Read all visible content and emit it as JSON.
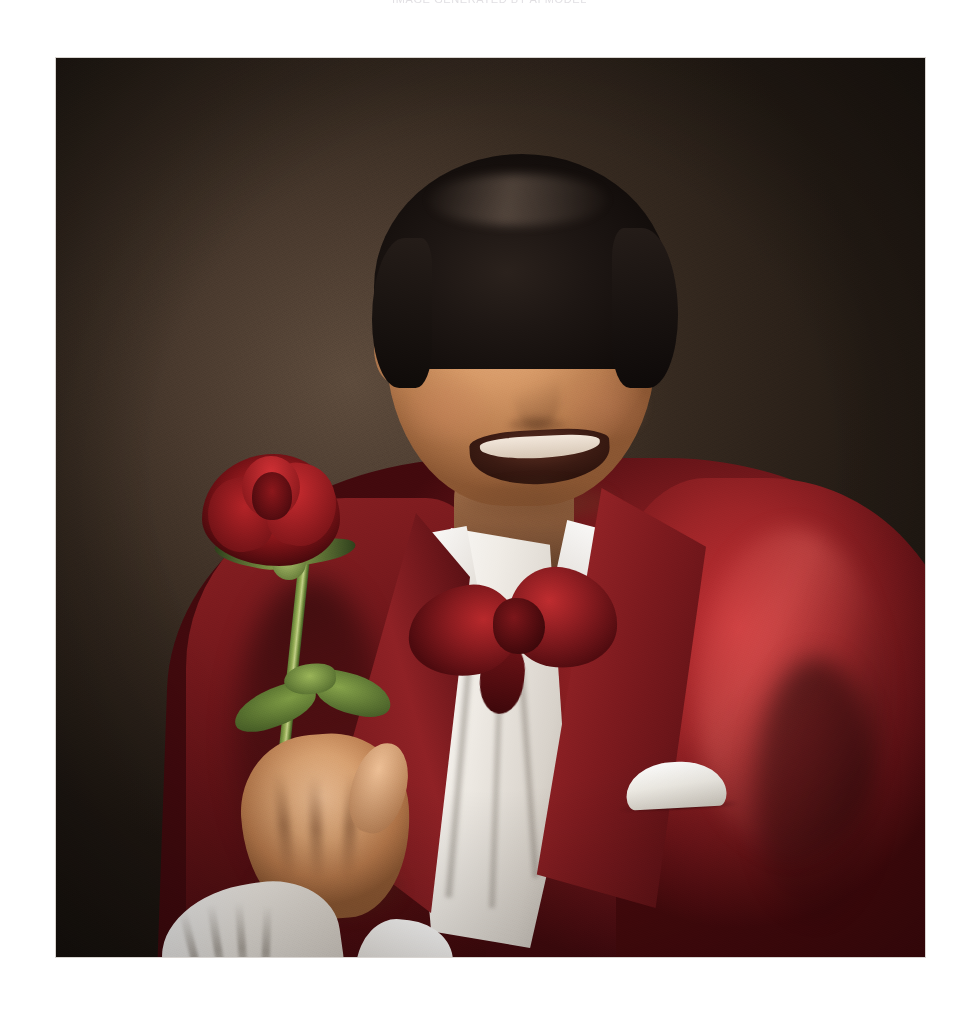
{
  "page": {
    "background_color": "#ffffff",
    "width": 979,
    "height": 1015
  },
  "top_caption": {
    "text": "IMAGE GENERATED BY AI MODEL",
    "note": "clipped at top edge of page, only faint glyph bottoms visible"
  },
  "photo": {
    "alt_description": "Studio portrait photograph of a smiling middle-aged man with dark swept-back hair, wearing a glossy red satin tuxedo jacket over a white ruffled dress shirt with a large crimson bow tie and a white pocket square, holding a single long-stemmed red rose in his right hand.",
    "frame": {
      "left": 56,
      "top": 58,
      "width": 869,
      "height": 899
    },
    "colors": {
      "backdrop_dark": "#2e241c",
      "backdrop_light": "#5d4b3c",
      "jacket_red": "#9c2427",
      "jacket_highlight": "#c23034",
      "jacket_shadow": "#42090d",
      "shirt_white": "#ffffff",
      "shirt_shadow": "#b9b2a9",
      "bowtie_red": "#8e1d21",
      "rose_red": "#9b1a1e",
      "rose_highlight": "#d13135",
      "stem_green": "#93ab53",
      "leaf_green": "#7d9a44",
      "skin_light": "#ecbd93",
      "skin_mid": "#d79a68",
      "skin_shadow": "#8a5632",
      "hair_dark": "#1d1613"
    },
    "elements": {
      "backdrop": "mottled dark brown studio backdrop with soft vignette",
      "head": "smiling face, eyes creased, visible teeth",
      "hair": "dark brown-black hair swept back with a glossy sheen",
      "neck": "open neck above collar",
      "collar": "pointed white shirt collar wings",
      "bow_tie": "oversized crimson satin bow tie",
      "shirt": "white ruffled/pleated formal shirt front",
      "jacket": "red satin dinner jacket with wide peak lapels",
      "pocket_square": "white folded pocket square at left breast",
      "rose": "single deep-red rose bloom with green sepals",
      "stem": "long green rose stem angled down-right",
      "leaves": "three green rose leaves on the stem",
      "hand": "right hand gripping the rose stem",
      "cuff": "ruffled white lace shirt cuff at the wrist"
    }
  }
}
